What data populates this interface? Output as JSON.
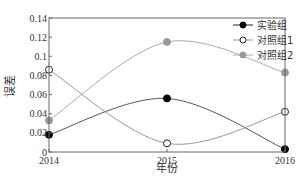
{
  "chart_data": {
    "type": "line",
    "title": "",
    "xlabel": "年份",
    "ylabel": "误差",
    "x": [
      "2014",
      "2015",
      "2016"
    ],
    "ylim": [
      0,
      0.14
    ],
    "yticks": [
      "0",
      "0.02",
      "0.04",
      "0.06",
      "0.08",
      "0.1",
      "0.12",
      "0.14"
    ],
    "grid": false,
    "legend_position": "upper right",
    "smooth": true,
    "series": [
      {
        "name": "实验组",
        "values": [
          0.018,
          0.056,
          0.003
        ],
        "color": "#000000",
        "line_color": "#555555",
        "marker": "filled-circle"
      },
      {
        "name": "对照组1",
        "values": [
          0.086,
          0.009,
          0.042
        ],
        "color": "#ffffff",
        "line_color": "#999999",
        "marker": "open-circle"
      },
      {
        "name": "对照组2",
        "values": [
          0.033,
          0.115,
          0.083
        ],
        "color": "#999999",
        "line_color": "#aaaaaa",
        "marker": "gray-circle"
      }
    ]
  }
}
